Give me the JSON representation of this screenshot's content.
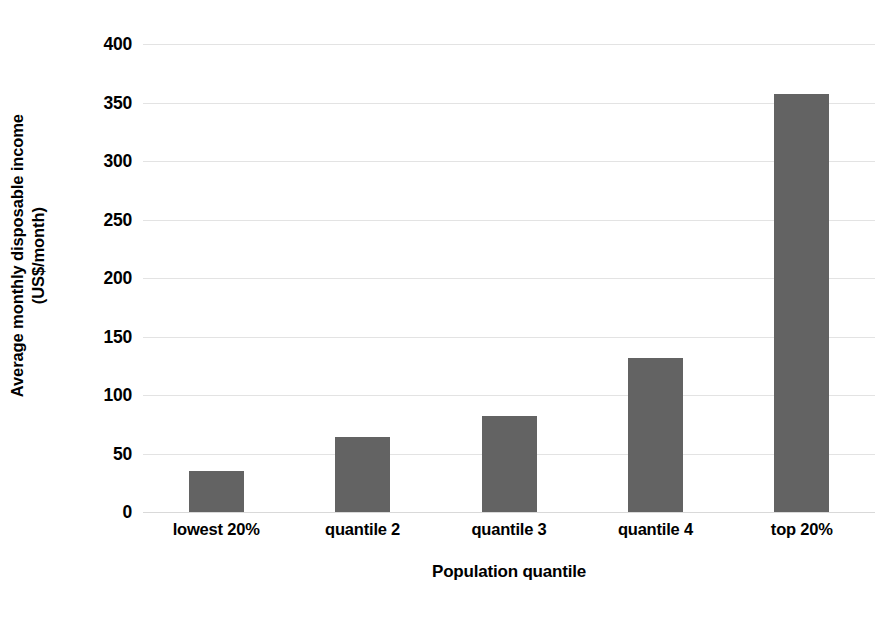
{
  "chart_data": {
    "type": "bar",
    "title": "",
    "subtitle": "",
    "xlabel": "Population quantile",
    "ylabel": "Average monthly disposable income (US$/month)",
    "ylabel_line1": "Average monthly disposable income",
    "ylabel_line2": "(US$/month)",
    "categories": [
      "lowest 20%",
      "quantile 2",
      "quantile 3",
      "quantile 4",
      "top 20%"
    ],
    "values": [
      35,
      64,
      82,
      132,
      357
    ],
    "series": [
      {
        "name": "Average monthly disposable income",
        "values": [
          35,
          64,
          82,
          132,
          357
        ]
      }
    ],
    "ylim": [
      0,
      400
    ],
    "ytick_step": 50,
    "ytick_labels": [
      "400",
      "350",
      "300",
      "250",
      "200",
      "150",
      "100",
      "50",
      "0"
    ],
    "ytick_values": [
      400,
      350,
      300,
      250,
      200,
      150,
      100,
      50,
      0
    ],
    "grid": true,
    "grid_axis": "y",
    "legend": false,
    "legend_position": "none",
    "bar_color": "#636363",
    "gridline_color": "#e3e3e3",
    "background_color": "#ffffff",
    "text_color": "#000000"
  }
}
